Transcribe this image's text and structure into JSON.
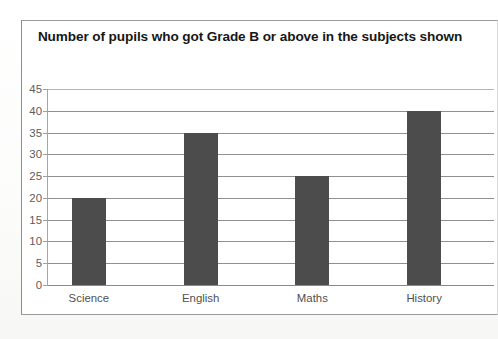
{
  "chart_data": {
    "type": "bar",
    "title": "Number of pupils who got Grade B or above in the subjects shown",
    "title_line1": "Number of pupils who got Grade B or above in the",
    "title_line2": "subjects shown",
    "categories": [
      "Science",
      "English",
      "Maths",
      "History"
    ],
    "values": [
      20,
      35,
      25,
      40
    ],
    "xlabel": "",
    "ylabel": "",
    "ylim": [
      0,
      45
    ],
    "ytick_step": 5,
    "yticks": [
      45,
      40,
      35,
      30,
      25,
      20,
      15,
      10,
      5,
      0
    ],
    "grid": true,
    "legend": false,
    "bar_color": "#4c4c4c",
    "gridline_color": "#8f8f8f",
    "axis_label_color": "#5d5d5d",
    "title_color": "#171717",
    "plot_background": "#ffffff"
  }
}
